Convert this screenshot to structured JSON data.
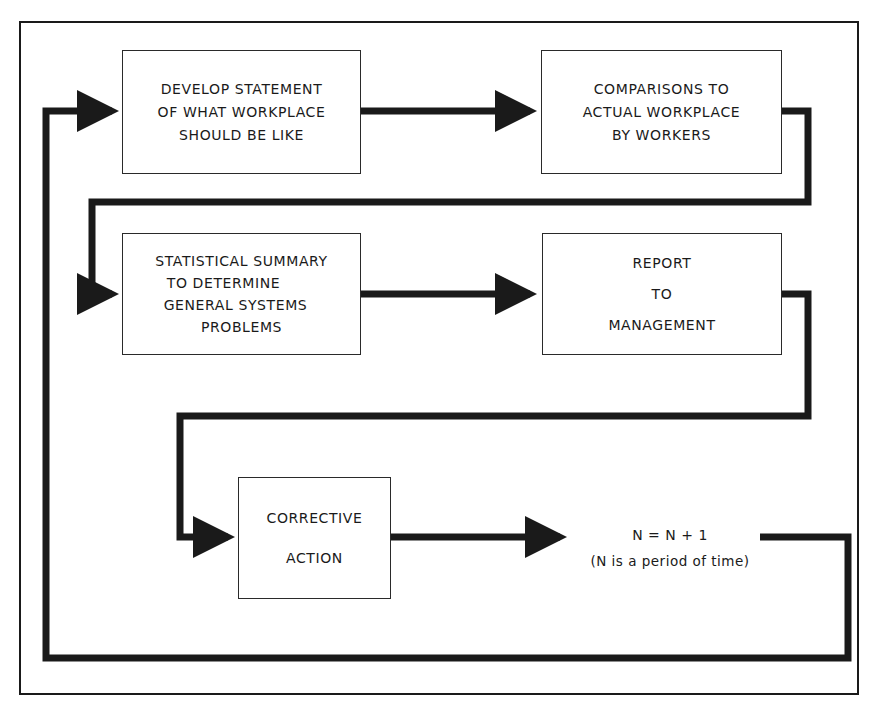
{
  "diagram": {
    "type": "process-flow-loop",
    "steps": [
      {
        "id": "step1",
        "lines": [
          "DEVELOP STATEMENT",
          "OF WHAT WORKPLACE",
          "SHOULD BE LIKE"
        ]
      },
      {
        "id": "step2",
        "lines": [
          "COMPARISONS TO",
          "ACTUAL WORKPLACE",
          "BY WORKERS"
        ]
      },
      {
        "id": "step3",
        "lines": [
          "STATISTICAL SUMMARY",
          "TO DETERMINE",
          "GENERAL SYSTEMS",
          "PROBLEMS"
        ]
      },
      {
        "id": "step4",
        "lines": [
          "REPORT",
          "TO",
          "MANAGEMENT"
        ]
      },
      {
        "id": "step5",
        "lines": [
          "CORRECTIVE",
          "ACTION"
        ]
      }
    ],
    "increment": {
      "equation": "N = N + 1",
      "caption": "(N is a period of time)"
    },
    "flow": [
      "step1",
      "step2",
      "step3",
      "step4",
      "step5",
      "increment",
      "step1"
    ],
    "colors": {
      "line": "#1a1a1a",
      "background": "#ffffff"
    }
  }
}
